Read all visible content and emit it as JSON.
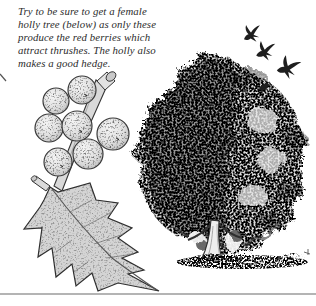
{
  "page": {
    "caption": {
      "lines": [
        "Try to be sure to get a female",
        "holly tree (below) as only these",
        "produce the red berries which",
        "attract thrushes. The holly also",
        "makes a good hedge."
      ]
    },
    "illustration": {
      "holly_sprig": {
        "name": "holly-sprig-with-berries",
        "berry_count": 7
      },
      "holly_tree": {
        "name": "female-holly-tree"
      },
      "flying_bird_count": 3,
      "perched_bird_count": 1
    },
    "colors": {
      "paper": "#ffffff",
      "ink": "#2b2b2b",
      "shade_light": "#d8d8d8",
      "shade_dark": "#4f4f4f",
      "rule": "#9b9b9b"
    },
    "divider_rule": true
  }
}
